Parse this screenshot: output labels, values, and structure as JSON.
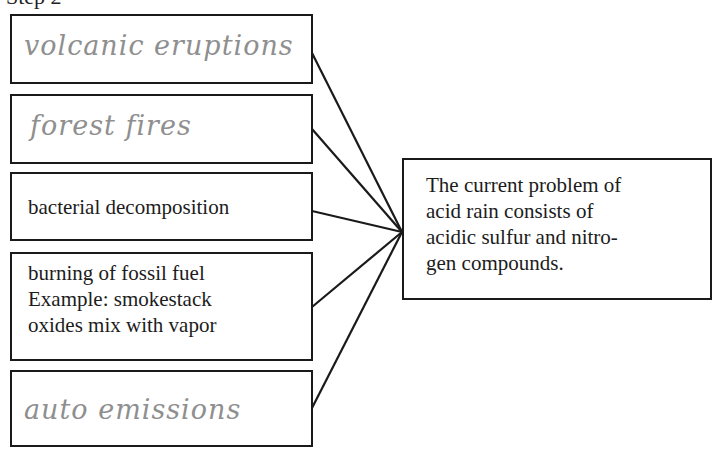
{
  "header": {
    "title": "Step 2"
  },
  "causes": [
    {
      "id": "volcanic",
      "text": "volcanic eruptions",
      "style": "handwritten"
    },
    {
      "id": "forest",
      "text": "forest fires",
      "style": "handwritten"
    },
    {
      "id": "bacterial",
      "text": "bacterial decomposition",
      "style": "printed"
    },
    {
      "id": "fossil",
      "lines": [
        "burning of fossil fuel",
        "Example: smokestack",
        "oxides mix with vapor"
      ],
      "style": "printed"
    },
    {
      "id": "auto",
      "text": "auto emissions",
      "style": "handwritten"
    }
  ],
  "result": {
    "lines": [
      "The current problem of",
      "acid rain consists of",
      "acidic sulfur and nitro-",
      "gen compounds."
    ]
  },
  "colors": {
    "line": "#1a1a1a",
    "handwriting": "#8f8f8f",
    "print": "#1c1c1c"
  }
}
